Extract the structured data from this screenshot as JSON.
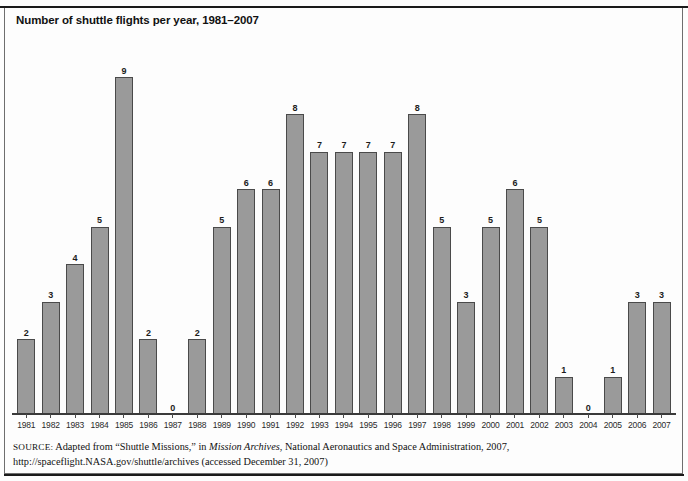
{
  "figure": {
    "title": "Number of shuttle flights per year, 1981–2007",
    "source_label": "SOURCE:",
    "source_text_1": "Adapted from “Shuttle Missions,” in ",
    "source_italic": "Mission Archives",
    "source_text_2": ", National Aeronautics and Space Administration, 2007, http://spaceflight.NASA.gov/shuttle/archives (accessed December 31, 2007)"
  },
  "colors": {
    "bar_fill": "#9a9a9a",
    "bar_border": "#4a4a4a",
    "frame": "#6e6e6e",
    "text": "#111111"
  },
  "chart_data": {
    "type": "bar",
    "title": "Number of shuttle flights per year, 1981–2007",
    "xlabel": "",
    "ylabel": "",
    "ylim": [
      0,
      9
    ],
    "grid": false,
    "legend": "none",
    "categories": [
      "1981",
      "1982",
      "1983",
      "1984",
      "1985",
      "1986",
      "1987",
      "1988",
      "1989",
      "1990",
      "1991",
      "1992",
      "1993",
      "1994",
      "1995",
      "1996",
      "1997",
      "1998",
      "1999",
      "2000",
      "2001",
      "2002",
      "2003",
      "2004",
      "2005",
      "2006",
      "2007"
    ],
    "values": [
      2,
      3,
      4,
      5,
      9,
      2,
      0,
      2,
      5,
      6,
      6,
      8,
      7,
      7,
      7,
      7,
      8,
      5,
      3,
      5,
      6,
      5,
      1,
      0,
      1,
      3,
      3
    ],
    "data_labels": [
      "2",
      "3",
      "4",
      "5",
      "9",
      "2",
      "0",
      "2",
      "5",
      "6",
      "6",
      "8",
      "7",
      "7",
      "7",
      "7",
      "8",
      "5",
      "3",
      "5",
      "6",
      "5",
      "1",
      "0",
      "1",
      "3",
      "3"
    ]
  }
}
